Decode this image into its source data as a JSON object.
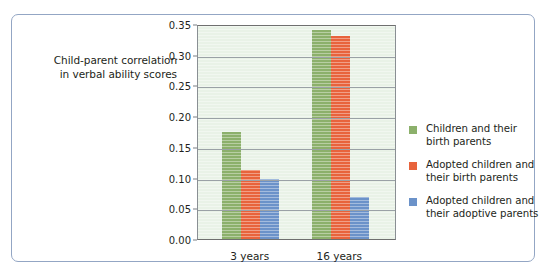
{
  "figure": {
    "axis_title_line1": "Child-parent correlation",
    "axis_title_line2": "in verbal ability scores",
    "border_color": "#93a6c4",
    "plot_background": "#e9f2e7"
  },
  "chart_data": {
    "type": "bar",
    "title": "",
    "xlabel": "",
    "ylabel": "Child-parent correlation in verbal ability scores",
    "categories": [
      "3 years",
      "16 years"
    ],
    "ylim": [
      0.0,
      0.35
    ],
    "yticks": [
      0.0,
      0.05,
      0.1,
      0.15,
      0.2,
      0.25,
      0.3,
      0.35
    ],
    "ytick_labels": [
      "0.00",
      "0.05",
      "0.10",
      "0.15",
      "0.20",
      "0.25",
      "0.30",
      "0.35"
    ],
    "grid": true,
    "legend_position": "right",
    "series": [
      {
        "name": "Children and their birth parents",
        "name_line1": "Children and their",
        "name_line2": "birth parents",
        "color": "#8cb06b",
        "values": [
          0.175,
          0.34
        ]
      },
      {
        "name": "Adopted children and their birth parents",
        "name_line1": "Adopted children and",
        "name_line2": "their birth parents",
        "color": "#e8633c",
        "values": [
          0.112,
          0.33
        ]
      },
      {
        "name": "Adopted children and their adoptive parents",
        "name_line1": "Adopted children and",
        "name_line2": "their adoptive parents",
        "color": "#6b92c9",
        "values": [
          0.097,
          0.068
        ]
      }
    ]
  }
}
